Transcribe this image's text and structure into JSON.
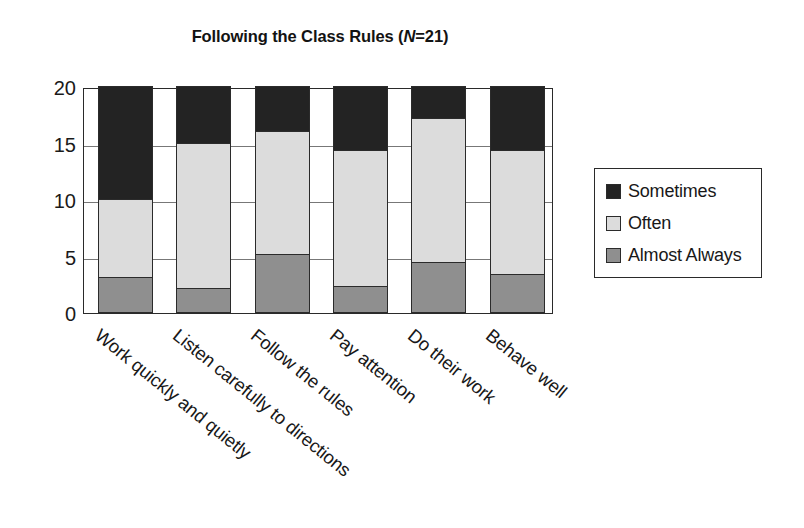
{
  "chart_data": {
    "type": "bar",
    "subtype": "stacked-column",
    "title": "Following the Class Rules (N=21)",
    "title_prefix": "Following the Class Rules (",
    "title_italic": "N",
    "title_suffix": "=21)",
    "xlabel": "",
    "ylabel": "",
    "ylim": [
      0,
      20
    ],
    "yticks": [
      0,
      5,
      10,
      15,
      20
    ],
    "ytick_labels": [
      "0",
      "5",
      "10",
      "15",
      "20"
    ],
    "grid": true,
    "legend_position": "right",
    "categories": [
      "Work quickly and quietly",
      "Listen carefully to directions",
      "Follow the rules",
      "Pay attention",
      "Do their work",
      "Behave well"
    ],
    "series": [
      {
        "name": "Almost Always",
        "color": "#8f8f8f",
        "values": [
          3.1,
          2.1,
          5.1,
          2.3,
          4.4,
          3.4
        ]
      },
      {
        "name": "Often",
        "color": "#dcdcdc",
        "values": [
          6.9,
          12.9,
          10.9,
          12.0,
          12.8,
          10.9
        ]
      },
      {
        "name": "Sometimes",
        "color": "#232323",
        "values": [
          10.0,
          5.0,
          4.0,
          5.7,
          2.8,
          5.7
        ]
      }
    ],
    "stack_order_bottom_to_top": [
      "Almost Always",
      "Often",
      "Sometimes"
    ],
    "legend_entries": [
      {
        "label": "Sometimes",
        "color": "#232323"
      },
      {
        "label": "Often",
        "color": "#dcdcdc"
      },
      {
        "label": "Almost Always",
        "color": "#8f8f8f"
      }
    ]
  }
}
